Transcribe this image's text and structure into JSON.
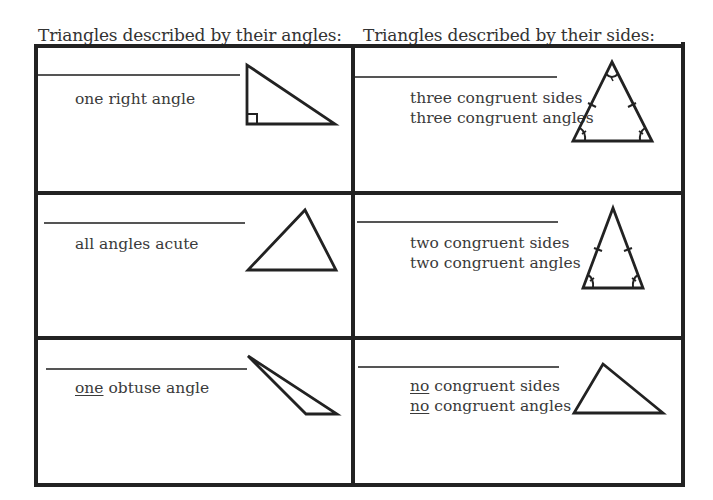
{
  "headings": {
    "angles": "Triangles described by their angles:",
    "sides": "Triangles described by their sides:"
  },
  "angles_column": [
    {
      "answer": "",
      "description": {
        "underlined": "",
        "text": "one right angle"
      },
      "figure": "right-triangle-icon"
    },
    {
      "answer": "",
      "description": {
        "underlined": "",
        "text": "all angles acute"
      },
      "figure": "acute-triangle-icon"
    },
    {
      "answer": "",
      "description": {
        "underlined": "one",
        "text": " obtuse angle"
      },
      "figure": "obtuse-triangle-icon"
    }
  ],
  "sides_column": [
    {
      "answer": "",
      "description_lines": [
        {
          "underlined": "",
          "text": "three congruent sides"
        },
        {
          "underlined": "",
          "text": "three congruent angles"
        }
      ],
      "figure": "equilateral-triangle-icon"
    },
    {
      "answer": "",
      "description_lines": [
        {
          "underlined": "",
          "text": "two congruent sides"
        },
        {
          "underlined": "",
          "text": "two congruent angles"
        }
      ],
      "figure": "isosceles-triangle-icon"
    },
    {
      "answer": "",
      "description_lines": [
        {
          "underlined": "no",
          "text": " congruent sides"
        },
        {
          "underlined": "no",
          "text": " congruent angles"
        }
      ],
      "figure": "scalene-triangle-icon"
    }
  ],
  "colors": {
    "border": "#222222",
    "text": "#3a3a3a",
    "line": "#555555"
  }
}
